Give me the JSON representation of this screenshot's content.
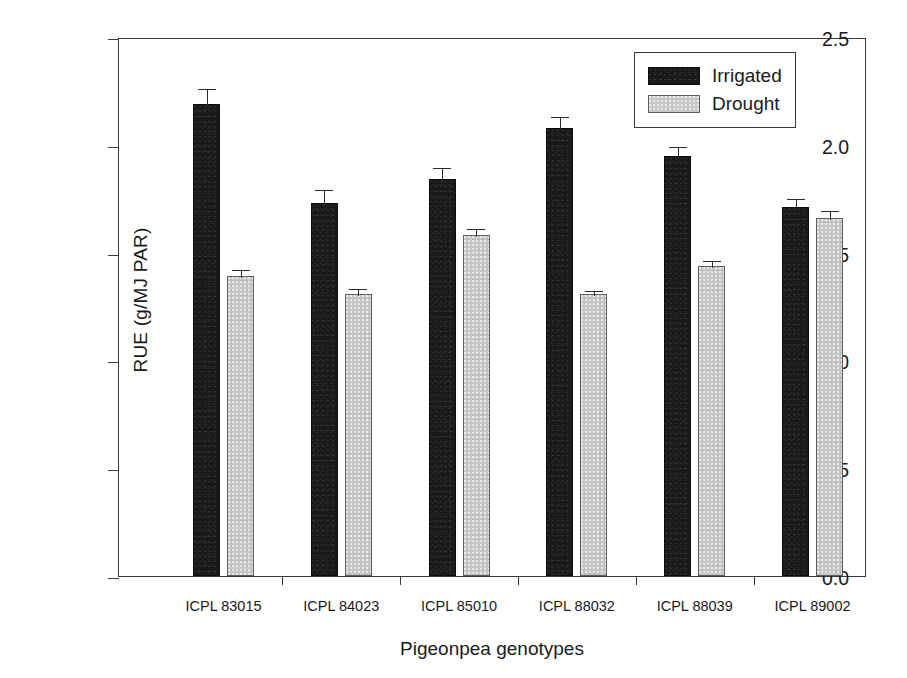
{
  "chart_data": {
    "type": "bar",
    "title": "",
    "xlabel": "Pigeonpea genotypes",
    "ylabel": "RUE (g/MJ PAR)",
    "ylim": [
      0.0,
      2.5
    ],
    "ytick_labels": [
      "0.0",
      "0.5",
      "1.0",
      "1.5",
      "2.0",
      "2.5"
    ],
    "ytick_values": [
      0.0,
      0.5,
      1.0,
      1.5,
      2.0,
      2.5
    ],
    "grid": false,
    "legend_position": "top-right",
    "categories": [
      "ICPL 83015",
      "ICPL 84023",
      "ICPL 85010",
      "ICPL 88032",
      "ICPL 88039",
      "ICPL 89002"
    ],
    "series": [
      {
        "name": "Irrigated",
        "color": "#1a1a1a",
        "values": [
          2.19,
          1.73,
          1.84,
          2.08,
          1.95,
          1.71
        ],
        "errors": [
          0.08,
          0.07,
          0.06,
          0.06,
          0.05,
          0.05
        ]
      },
      {
        "name": "Drought",
        "color": "#c6c6c6",
        "values": [
          1.39,
          1.31,
          1.58,
          1.31,
          1.44,
          1.66
        ],
        "errors": [
          0.04,
          0.03,
          0.04,
          0.02,
          0.03,
          0.04
        ]
      }
    ]
  },
  "legend": {
    "entries": [
      {
        "label": "Irrigated",
        "swatch": "irrigated"
      },
      {
        "label": "Drought",
        "swatch": "drought"
      }
    ]
  }
}
